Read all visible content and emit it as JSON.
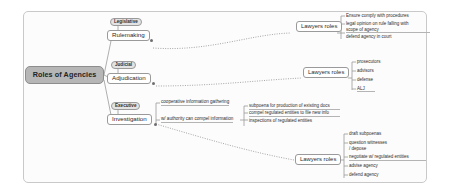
{
  "diagram": {
    "title": "Roles of Agencies",
    "type": "mind-map"
  },
  "root": {
    "label": "Roles of Agencies"
  },
  "branches": [
    {
      "chip": "Legislative",
      "label": "Rulemaking",
      "lawyers_label": "Lawyers roles",
      "leaves": [
        "Ensure comply with procedures",
        "legal opinion on rule falling with",
        "scope of agency",
        "defend agency in court"
      ]
    },
    {
      "chip": "Judicial",
      "label": "Adjudication",
      "lawyers_label": "Lawyers roles",
      "leaves": [
        "prosecutors",
        "advisors",
        "defense",
        "ALJ"
      ]
    },
    {
      "chip": "Executive",
      "label": "Investigation",
      "lawyers_label": "Lawyers roles",
      "mid_notes": [
        "cooperative information gathering",
        "w/ authority can compel information"
      ],
      "compel_leaves": [
        "subpoena for production of existing docs",
        "compel regulated entities to file new info",
        "inspections of regulated entities"
      ],
      "leaves": [
        "draft subpoenas",
        "question witnesses",
        "/ depose",
        "negotiate w/ regulated entities",
        "advise agency",
        "defend agency"
      ]
    }
  ],
  "colors": {
    "root_fill": "#b6b6b6",
    "chip_fill": "#e3e3e3",
    "node_fill": "#ffffff",
    "node_border": "#9a9a9a",
    "connector": "#9a9a9a",
    "frame_border": "#c9c9c9",
    "canvas": "#fcfcfc",
    "text": "#2b2b2b"
  }
}
